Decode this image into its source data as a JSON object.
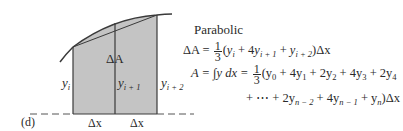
{
  "figure": {
    "panel_label": "(d)",
    "title": "Parabolic",
    "diagram": {
      "area_label": "ΔA",
      "ordinates": [
        {
          "name": "y",
          "sub": "i"
        },
        {
          "name": "y",
          "sub": "i + 1"
        },
        {
          "name": "y",
          "sub": "i + 2"
        }
      ],
      "intervals": [
        "Δx",
        "Δx"
      ],
      "colors": {
        "shade": "#c4c4c4",
        "line": "#3a3a3a",
        "background": "#ffffff"
      }
    },
    "equations": {
      "eq1": {
        "lhs": "ΔA =",
        "frac_num": "1",
        "frac_den": "3",
        "body": [
          "(",
          "y",
          "i",
          " + 4",
          "y",
          "i + 1",
          " + ",
          "y",
          "i + 2",
          ")Δx"
        ]
      },
      "eq2": {
        "lhs": "A = ∫y dx =",
        "frac_num": "1",
        "frac_den": "3",
        "terms": [
          "(y",
          "0",
          " + 4y",
          "1",
          " + 2y",
          "2",
          " + 4y",
          "3",
          " + 2y",
          "4"
        ]
      },
      "eq3": {
        "terms": [
          "+ ⋯ + 2y",
          "n − 2",
          " + 4y",
          "n − 1",
          " + y",
          "n",
          ")Δx"
        ]
      }
    }
  }
}
